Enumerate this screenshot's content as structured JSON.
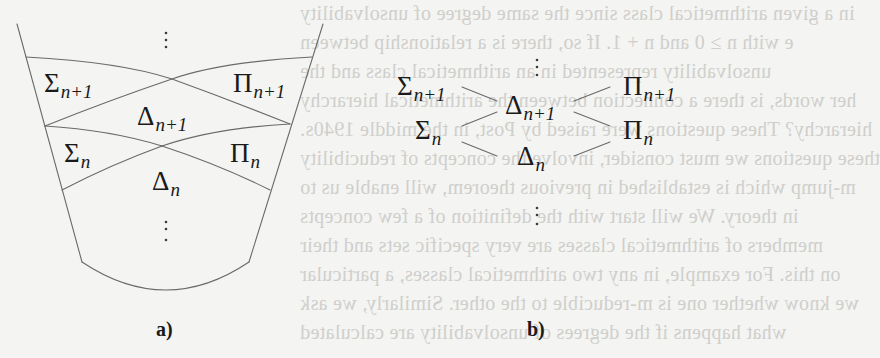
{
  "figure": {
    "panel_a": {
      "caption": "a)",
      "labels": {
        "sigma_n1": {
          "base": "Σ",
          "sub": "n+1"
        },
        "pi_n1": {
          "base": "Π",
          "sub": "n+1"
        },
        "delta_n1": {
          "base": "Δ",
          "sub": "n+1"
        },
        "sigma_n": {
          "base": "Σ",
          "sub": "n"
        },
        "pi_n": {
          "base": "Π",
          "sub": "n"
        },
        "delta_n": {
          "base": "Δ",
          "sub": "n"
        }
      },
      "ellipsis_top": "⋮",
      "ellipsis_bottom": "⋮"
    },
    "panel_b": {
      "caption": "b)",
      "labels": {
        "sigma_n1": {
          "base": "Σ",
          "sub": "n+1"
        },
        "pi_n1": {
          "base": "Π",
          "sub": "n+1"
        },
        "delta_n1": {
          "base": "Δ",
          "sub": "n+1"
        },
        "sigma_n": {
          "base": "Σ",
          "sub": "n"
        },
        "pi_n": {
          "base": "Π",
          "sub": "n"
        },
        "delta_n": {
          "base": "Δ",
          "sub": "n"
        }
      },
      "ellipsis_top": "⋮",
      "ellipsis_bottom": "⋮"
    },
    "line_color": "#6a6a6a",
    "text_color": "#1a1a1a",
    "background": "#f4f4f2"
  },
  "bleed_through_text": [
    "in a given arithmetical class since the same degree of unsolvability",
    "e with n ≥ 0 and n + 1. If so, there is a relationship between",
    "unsolvability represented in an arithmetical class and the",
    "her words, is there a connection between the arithmetical hierarchy",
    "hierarchy? These questions were raised by Post, in the middle 1940s.",
    "these questions we must consider, involve the concepts of reducibility",
    "m-jump which is established in previous theorem, will enable us to",
    "in theory. We will start with the definition of a few concepts",
    "members of arithmetical classes are very specific sets and their",
    "on this. For example, in any two arithmetical classes, a particular",
    "we know whether one is m-reducible to the other. Similarly, we ask",
    "what happens if the degrees of unsolvability are calculated"
  ]
}
